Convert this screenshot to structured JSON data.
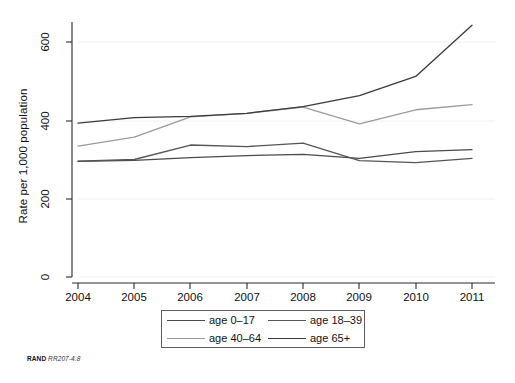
{
  "chart_data": {
    "type": "line",
    "title": "",
    "xlabel": "",
    "ylabel": "Rate per 1,000 population",
    "x": [
      2004,
      2005,
      2006,
      2007,
      2008,
      2009,
      2010,
      2011
    ],
    "xticklabels": [
      "2004",
      "2005",
      "2006",
      "2007",
      "2008",
      "2009",
      "2010",
      "2011"
    ],
    "yticklabels": [
      "0",
      "200",
      "400",
      "600"
    ],
    "yticks": [
      0,
      200,
      400,
      600
    ],
    "ylim": [
      0,
      660
    ],
    "xlim": [
      2004,
      2011
    ],
    "grid": "horizontal-faint",
    "legend_position": "below-center",
    "series": [
      {
        "name": "age 0-17",
        "label": "age 0–17",
        "color": "#4a4a4a",
        "values": [
          295,
          298,
          305,
          310,
          313,
          303,
          320,
          325
        ]
      },
      {
        "name": "age 18-39",
        "label": "age 18–39",
        "color": "#555555",
        "values": [
          296,
          300,
          337,
          333,
          342,
          297,
          292,
          303
        ]
      },
      {
        "name": "age 40-64",
        "label": "age 40–64",
        "color": "#9a9a9a",
        "values": [
          334,
          357,
          409,
          418,
          434,
          391,
          427,
          440
        ]
      },
      {
        "name": "age 65+",
        "label": "age 65+",
        "color": "#3a3a3a",
        "values": [
          393,
          407,
          410,
          418,
          435,
          463,
          512,
          643
        ]
      }
    ]
  },
  "axis": {
    "y_title": "Rate per 1,000 population"
  },
  "legend": {
    "entries": [
      {
        "label": "age 0–17"
      },
      {
        "label": "age 18–39"
      },
      {
        "label": "age 40–64"
      },
      {
        "label": "age 65+"
      }
    ]
  },
  "footer": {
    "mark": "RAND",
    "id": "RR207-4.8"
  }
}
